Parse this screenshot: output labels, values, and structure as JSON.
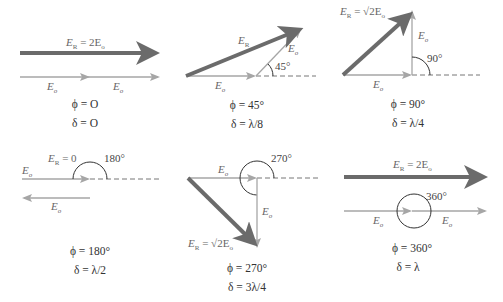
{
  "colors": {
    "resultant": "#6b6b6b",
    "component": "#a6a6a6",
    "dashed": "#777777",
    "arc": "#333333"
  },
  "panels": [
    {
      "id": "p1",
      "resultant_label": "E_R = 2E_o",
      "component_labels": [
        "E_o",
        "E_o"
      ],
      "angle_label": "",
      "phi": "ϕ = O",
      "delta": "δ = O"
    },
    {
      "id": "p2",
      "resultant_label": "E_R",
      "component_labels": [
        "E_o",
        "E_o"
      ],
      "angle_label": "45°",
      "phi": "ϕ = 45°",
      "delta": "δ = λ/8"
    },
    {
      "id": "p3",
      "resultant_label": "E_R = √2E_o",
      "component_labels": [
        "E_o",
        "E_o"
      ],
      "angle_label": "90°",
      "phi": "ϕ = 90°",
      "delta": "δ = λ/4"
    },
    {
      "id": "p4",
      "resultant_label": "E_R = 0",
      "component_labels": [
        "E_o",
        "E_o"
      ],
      "angle_label": "180°",
      "phi": "ϕ = 180°",
      "delta": "δ = λ/2"
    },
    {
      "id": "p5",
      "resultant_label": "E_R = √2E_o",
      "component_labels": [
        "E_o",
        "E_o"
      ],
      "angle_label": "270°",
      "phi": "ϕ = 270°",
      "delta": "δ = 3λ/4"
    },
    {
      "id": "p6",
      "resultant_label": "E_R = 2E_o",
      "component_labels": [
        "E_o",
        "E_o"
      ],
      "angle_label": "360°",
      "phi": "ϕ = 360°",
      "delta": "δ = λ"
    }
  ],
  "text": {
    "p1": {
      "er_main": "E",
      "er_sub": "R",
      "er_rest": " = 2E",
      "er_rest_sub": "o",
      "eo_a": "E",
      "eo_b": "E",
      "sub": "o"
    },
    "p2": {
      "er_main": "E",
      "er_sub": "R",
      "eo_a": "E",
      "eo_b": "E",
      "sub": "o"
    },
    "p3": {
      "er_main": "E",
      "er_sub": "R",
      "er_rest": " = √2E",
      "er_rest_sub": "o",
      "eo_a": "E",
      "eo_b": "E",
      "sub": "o"
    },
    "p4": {
      "er_main": "E",
      "er_sub": "R",
      "er_rest": " = 0",
      "eo_a": "E",
      "eo_b": "E",
      "sub": "o"
    },
    "p5": {
      "er_main": "E",
      "er_sub": "R",
      "er_rest": " = √2E",
      "er_rest_sub": "o",
      "eo_a": "E",
      "eo_b": "E",
      "sub": "o"
    },
    "p6": {
      "er_main": "E",
      "er_sub": "R",
      "er_rest": " = 2E",
      "er_rest_sub": "o",
      "eo_a": "E",
      "eo_b": "E",
      "sub": "o"
    }
  }
}
